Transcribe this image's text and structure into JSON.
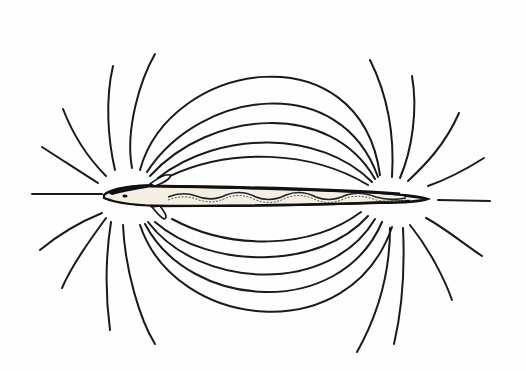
{
  "figure": {
    "description": "Line drawing of an elongated electric fish (eel-like) with curved electric field lines arching from the head region to the tail region, above and below the body",
    "colors": {
      "background": "#fefefe",
      "ink": "#1a1a1a",
      "fish_highlight": "#f4efe2"
    },
    "parts": {
      "fish": "electric-fish",
      "field_lines_top_count": 14,
      "field_lines_bottom_count": 14,
      "axial_lines_count": 2
    }
  }
}
